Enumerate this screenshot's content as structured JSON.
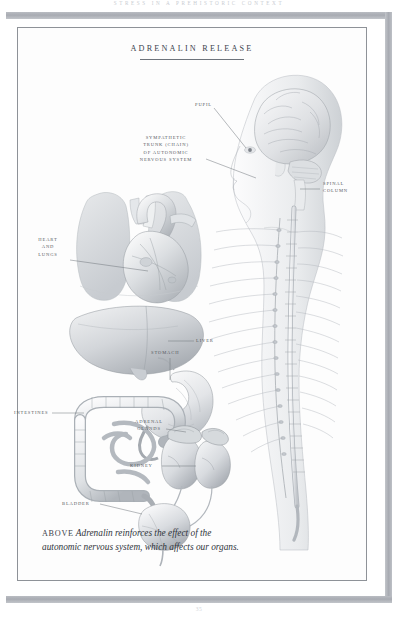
{
  "page": {
    "running_head": "STRESS IN A PREHISTORIC CONTEXT",
    "folio": "35"
  },
  "plate": {
    "title": "ADRENALIN RELEASE"
  },
  "labels": [
    {
      "id": "pupil",
      "text": "PUPIL",
      "align": "right"
    },
    {
      "id": "sympathetic",
      "text": "SYMPATHETIC\nTRUNK (CHAIN)\nOF AUTONOMIC\nNERVOUS SYSTEM",
      "align": "center"
    },
    {
      "id": "spinal",
      "text": "SPINAL\nCOLUMN",
      "align": "left"
    },
    {
      "id": "heart_lungs",
      "text": "HEART\nAND\nLUNGS",
      "align": "center"
    },
    {
      "id": "liver",
      "text": "LIVER",
      "align": "left"
    },
    {
      "id": "stomach",
      "text": "STOMACH",
      "align": "left"
    },
    {
      "id": "adrenal",
      "text": "ADRENAL\nGLANDS",
      "align": "center"
    },
    {
      "id": "kidney",
      "text": "KIDNEY",
      "align": "left"
    },
    {
      "id": "intestines",
      "text": "INTESTINES",
      "align": "left"
    },
    {
      "id": "bladder",
      "text": "BLADDER",
      "align": "left"
    }
  ],
  "caption": {
    "lead": "ABOVE",
    "text": "Adrenalin reinforces the effect of the autonomic nervous system, which affects our organs."
  },
  "colors": {
    "ink": "#2f343b",
    "label_ink": "#55595f",
    "rule": "#a8abb2",
    "frame": "#8e9298",
    "art_light": "#f0f1f3",
    "art_mid": "#cfd2d6",
    "art_dark": "#9ba0a6"
  }
}
